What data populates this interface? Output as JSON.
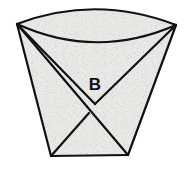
{
  "diagram": {
    "labels": [
      {
        "id": "flap-label",
        "text": "B"
      }
    ],
    "colors": {
      "paper_fill": "#e9e9e7",
      "outline": "#111111",
      "background": "#ffffff"
    }
  }
}
